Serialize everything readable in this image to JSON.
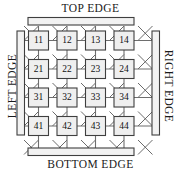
{
  "diagram": {
    "type": "node-grid",
    "colors": {
      "background": "#ffffff",
      "stroke": "#4a4a4a",
      "node_fill": "#efefef",
      "bar_fill": "#f2f2f2",
      "text": "#111111"
    },
    "edges": {
      "top_label": "TOP EDGE",
      "bottom_label": "BOTTOM EDGE",
      "left_label": "LEFT EDGE",
      "right_label": "RIGHT EDGE"
    },
    "grid": {
      "rows": 4,
      "cols": 4,
      "nodes": [
        [
          "11",
          "12",
          "13",
          "14"
        ],
        [
          "21",
          "22",
          "23",
          "24"
        ],
        [
          "31",
          "32",
          "33",
          "34"
        ],
        [
          "41",
          "42",
          "43",
          "44"
        ]
      ]
    }
  }
}
